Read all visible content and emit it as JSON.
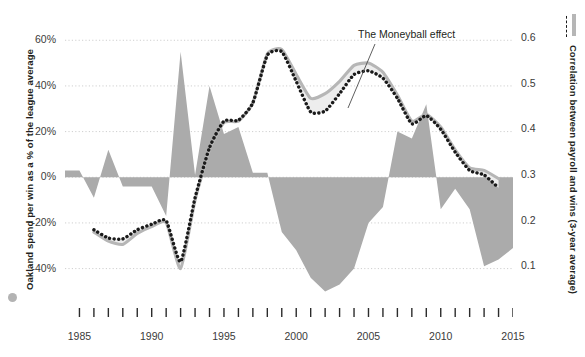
{
  "chart_data": {
    "type": "area",
    "title": "",
    "xlabel": "",
    "ylabel_left": "Oakland spend per win as a % of the league average",
    "ylabel_right": "Correlation between payroll and wins (3-year average)",
    "xlim": [
      1984,
      2015
    ],
    "x_ticks_labeled": [
      "1985",
      "1990",
      "1995",
      "2000",
      "2005",
      "2010",
      "2015"
    ],
    "x_tick_years": [
      1985,
      1986,
      1987,
      1988,
      1989,
      1990,
      1991,
      1992,
      1993,
      1994,
      1995,
      1996,
      1997,
      1998,
      1999,
      2000,
      2001,
      2002,
      2003,
      2004,
      2005,
      2006,
      2007,
      2008,
      2009,
      2010,
      2011,
      2012,
      2013,
      2014,
      2015
    ],
    "left_axis": {
      "ticks": [
        "60%",
        "40%",
        "20%",
        "0%",
        "-20%",
        "-40%"
      ],
      "values": [
        60,
        40,
        20,
        0,
        -20,
        -40
      ],
      "ylim": [
        -52,
        68
      ],
      "grid": true
    },
    "right_axis": {
      "ticks": [
        "0.6",
        "0.5",
        "0.4",
        "0.3",
        "0.2",
        "0.1"
      ],
      "values": [
        0.6,
        0.5,
        0.4,
        0.3,
        0.2,
        0.1
      ],
      "ylim": [
        0.035,
        0.635
      ],
      "grid": true
    },
    "annotations": [
      {
        "text": "The Moneyball effect",
        "x": 2004.1,
        "y_axis": "right"
      }
    ],
    "legend": [
      {
        "name": "Oakland spend per win as a % of the league average",
        "marker": "gray-dot",
        "style": "area",
        "color": "#ababab"
      },
      {
        "name": "Correlation between payroll and wins (3-year average) — all teams",
        "marker": "gray-line",
        "style": "solid-line",
        "color": "#b6b6b6"
      },
      {
        "name": "Correlation between payroll and wins (3-year average) — excluding Oakland",
        "marker": "dotted-line",
        "style": "dotted-line",
        "color": "#1a1a1a"
      }
    ],
    "series": [
      {
        "name": "Oakland spend per win as a % of the league average",
        "axis": "left",
        "type": "area",
        "color": "#ababab",
        "x": [
          1984,
          1985,
          1986,
          1987,
          1988,
          1989,
          1990,
          1991,
          1992,
          1993,
          1994,
          1995,
          1996,
          1997,
          1998,
          1999,
          2000,
          2001,
          2002,
          2003,
          2004,
          2005,
          2006,
          2007,
          2008,
          2009,
          2010,
          2011,
          2012,
          2013,
          2014,
          2015
        ],
        "values": [
          3,
          3,
          -9,
          12,
          -4,
          -4,
          -4,
          -17,
          55,
          1,
          40,
          19,
          22,
          2,
          2,
          -24,
          -32,
          -44,
          -50,
          -47,
          -40,
          -20,
          -13,
          20,
          17,
          32,
          -14,
          -5,
          -14,
          -39,
          -36,
          -31
        ]
      },
      {
        "name": "Correlation between payroll and wins (3-year average)",
        "axis": "right",
        "type": "line",
        "color": "#b6b6b6",
        "x": [
          1986,
          1987,
          1988,
          1989,
          1990,
          1991,
          1992,
          1993,
          1994,
          1995,
          1996,
          1997,
          1998,
          1999,
          2000,
          2001,
          2002,
          2003,
          2004,
          2005,
          2006,
          2007,
          2008,
          2009,
          2010,
          2011,
          2012,
          2013,
          2014
        ],
        "values": [
          0.175,
          0.155,
          0.148,
          0.172,
          0.187,
          0.196,
          0.095,
          0.245,
          0.355,
          0.415,
          0.418,
          0.458,
          0.565,
          0.575,
          0.52,
          0.468,
          0.478,
          0.505,
          0.54,
          0.545,
          0.525,
          0.475,
          0.418,
          0.433,
          0.405,
          0.355,
          0.316,
          0.31,
          0.292
        ]
      },
      {
        "name": "Correlation between payroll and wins (3-year average), dotted",
        "axis": "right",
        "type": "dotted-line",
        "color": "#1a1a1a",
        "x": [
          1986,
          1987,
          1988,
          1989,
          1990,
          1991,
          1992,
          1993,
          1994,
          1995,
          1996,
          1997,
          1998,
          1999,
          2000,
          2001,
          2002,
          2003,
          2004,
          2005,
          2006,
          2007,
          2008,
          2009,
          2010,
          2011,
          2012,
          2013,
          2014
        ],
        "values": [
          0.18,
          0.162,
          0.16,
          0.18,
          0.192,
          0.2,
          0.11,
          0.25,
          0.36,
          0.418,
          0.42,
          0.458,
          0.562,
          0.57,
          0.505,
          0.438,
          0.44,
          0.478,
          0.52,
          0.528,
          0.512,
          0.468,
          0.412,
          0.43,
          0.4,
          0.35,
          0.31,
          0.3,
          0.272
        ]
      }
    ]
  },
  "labels": {
    "left_axis_title": "Oakland spend per win as a % of the league average",
    "right_axis_title": "Correlation between payroll and wins (3-year average)",
    "moneyball_annotation": "The Moneyball effect",
    "y_left": [
      "60%",
      "40%",
      "20%",
      "0%",
      "-20%",
      "-40%"
    ],
    "y_right": [
      "0.6",
      "0.5",
      "0.4",
      "0.3",
      "0.2",
      "0.1"
    ],
    "x": [
      "1985",
      "1990",
      "1995",
      "2000",
      "2005",
      "2010",
      "2015"
    ]
  },
  "colors": {
    "area": "#ababab",
    "solid_line": "#b6b6b6",
    "dotted_line": "#1a1a1a",
    "grid": "#cfcfcf",
    "band_fill": "#ededed",
    "text": "#231f20"
  }
}
